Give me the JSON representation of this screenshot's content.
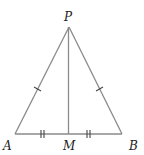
{
  "diagram": {
    "type": "isosceles-triangle-with-median",
    "points": {
      "P": {
        "label": "P",
        "x": 69,
        "y": 27
      },
      "A": {
        "label": "A",
        "x": 15,
        "y": 134
      },
      "B": {
        "label": "B",
        "x": 122,
        "y": 134
      },
      "M": {
        "label": "M",
        "x": 68,
        "y": 134
      }
    },
    "segments": [
      "PA",
      "PB",
      "AB",
      "PM"
    ],
    "congruence_marks": [
      {
        "segments": [
          "PA",
          "PB"
        ],
        "ticks": 1
      },
      {
        "segments": [
          "AM",
          "MB"
        ],
        "ticks": 2
      }
    ],
    "colors": {
      "line": "#8a8a8a",
      "label": "#222222",
      "tick": "#444444"
    }
  }
}
